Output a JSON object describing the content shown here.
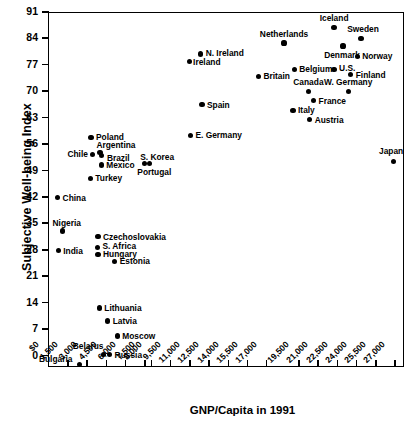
{
  "chart_data": {
    "type": "scatter",
    "title": "",
    "xlabel": "GNP/Capita in 1991",
    "ylabel": "Subjective Well-being Index",
    "xlim": [
      0,
      27750
    ],
    "ylim": [
      -3,
      91
    ],
    "grid": false,
    "legend": "none",
    "yticks": [
      0,
      7,
      14,
      21,
      28,
      35,
      42,
      49,
      56,
      63,
      70,
      77,
      84,
      91
    ],
    "ytick_labels": [
      "0",
      "7",
      "14",
      "21",
      "28",
      "35",
      "42",
      "49",
      "56",
      "63",
      "70",
      "77",
      "84",
      "91"
    ],
    "xticks": [
      0,
      1500,
      3000,
      4500,
      6000,
      7500,
      8000,
      9500,
      11000,
      12500,
      14000,
      15500,
      17000,
      19500,
      21000,
      22500,
      24000,
      25500,
      27000
    ],
    "xtick_labels": [
      "$0",
      "1,500",
      "3,000",
      "4,500",
      "6,000",
      "7,500",
      "8,000",
      "9,500",
      "11,000",
      "12,500",
      "14,000",
      "15,500",
      "17,000",
      "19,500",
      "21,000",
      "22,500",
      "24,000",
      "25,500",
      "27,000"
    ],
    "points": [
      {
        "label": "Iceland",
        "x": 22300,
        "y": 87.0,
        "side": "c",
        "lx": 0,
        "ly": -9
      },
      {
        "label": "Sweden",
        "x": 24400,
        "y": 84.0,
        "side": "c",
        "lx": 2,
        "ly": -9
      },
      {
        "label": "Denmark",
        "x": 23000,
        "y": 82.0,
        "side": "c",
        "lx": -1,
        "ly": 9
      },
      {
        "label": "Netherlands",
        "x": 18400,
        "y": 82.8,
        "side": "c",
        "lx": 0,
        "ly": -9
      },
      {
        "label": "Norway",
        "x": 24100,
        "y": 79.3,
        "side": "r",
        "lx": 5,
        "ly": 0
      },
      {
        "label": "N. Ireland",
        "x": 11900,
        "y": 79.9,
        "side": "r",
        "lx": 5,
        "ly": -1
      },
      {
        "label": "Ireland",
        "x": 11000,
        "y": 78.0,
        "side": "r",
        "lx": 4,
        "ly": 1
      },
      {
        "label": "U.S.",
        "x": 22300,
        "y": 75.8,
        "side": "r",
        "lx": 5,
        "ly": -1
      },
      {
        "label": "Belgium",
        "x": 19200,
        "y": 75.8,
        "side": "r",
        "lx": 5,
        "ly": 0
      },
      {
        "label": "Finland",
        "x": 23600,
        "y": 74.5,
        "side": "r",
        "lx": 5,
        "ly": 1
      },
      {
        "label": "Britain",
        "x": 16400,
        "y": 74.0,
        "side": "r",
        "lx": 5,
        "ly": 0
      },
      {
        "label": "Canada",
        "x": 20300,
        "y": 70.0,
        "side": "c",
        "lx": 0,
        "ly": -9
      },
      {
        "label": "W. Germany",
        "x": 23400,
        "y": 70.0,
        "side": "c",
        "lx": 0,
        "ly": -9
      },
      {
        "label": "France",
        "x": 20700,
        "y": 67.5,
        "side": "r",
        "lx": 5,
        "ly": 0
      },
      {
        "label": "Spain",
        "x": 12000,
        "y": 66.5,
        "side": "r",
        "lx": 5,
        "ly": 0
      },
      {
        "label": "Italy",
        "x": 19100,
        "y": 65.0,
        "side": "r",
        "lx": 5,
        "ly": 0
      },
      {
        "label": "Austria",
        "x": 20400,
        "y": 62.5,
        "side": "r",
        "lx": 5,
        "ly": 0
      },
      {
        "label": "E. Germany",
        "x": 11100,
        "y": 58.3,
        "side": "r",
        "lx": 5,
        "ly": 0
      },
      {
        "label": "Japan",
        "x": 26900,
        "y": 51.5,
        "side": "c",
        "lx": -2,
        "ly": -10
      },
      {
        "label": "Poland",
        "x": 3350,
        "y": 57.8,
        "side": "r",
        "lx": 5,
        "ly": 0
      },
      {
        "label": "Argentina",
        "x": 4050,
        "y": 53.9,
        "side": "c",
        "lx": 16,
        "ly": -7
      },
      {
        "label": "Chile",
        "x": 3500,
        "y": 53.3,
        "side": "l",
        "lx": -5,
        "ly": 0
      },
      {
        "label": "Brazil",
        "x": 4200,
        "y": 53.1,
        "side": "r",
        "lx": 5,
        "ly": 3
      },
      {
        "label": "Mexico",
        "x": 4150,
        "y": 50.5,
        "side": "r",
        "lx": 5,
        "ly": 0
      },
      {
        "label": "S. Korea",
        "x": 7500,
        "y": 50.8,
        "side": "c",
        "lx": 13,
        "ly": -7
      },
      {
        "label": "Portugal",
        "x": 7900,
        "y": 50.8,
        "side": "c",
        "lx": 5,
        "ly": 8
      },
      {
        "label": "Turkey",
        "x": 3300,
        "y": 47.0,
        "side": "r",
        "lx": 5,
        "ly": 0
      },
      {
        "label": "China",
        "x": 750,
        "y": 41.8,
        "side": "r",
        "lx": 5,
        "ly": 0
      },
      {
        "label": "Nigeria",
        "x": 1150,
        "y": 33.0,
        "side": "c",
        "lx": 4,
        "ly": -8
      },
      {
        "label": "Czechoslovakia",
        "x": 3900,
        "y": 31.5,
        "side": "r",
        "lx": 5,
        "ly": 0
      },
      {
        "label": "S. Africa",
        "x": 3850,
        "y": 28.7,
        "side": "r",
        "lx": 5,
        "ly": -1
      },
      {
        "label": "India",
        "x": 800,
        "y": 27.8,
        "side": "r",
        "lx": 5,
        "ly": 0
      },
      {
        "label": "Hungary",
        "x": 3900,
        "y": 26.8,
        "side": "r",
        "lx": 5,
        "ly": 0
      },
      {
        "label": "Estonia",
        "x": 5200,
        "y": 25.0,
        "side": "r",
        "lx": 5,
        "ly": 0
      },
      {
        "label": "Lithuania",
        "x": 4000,
        "y": 12.6,
        "side": "r",
        "lx": 5,
        "ly": 0
      },
      {
        "label": "Latvia",
        "x": 4650,
        "y": 9.2,
        "side": "r",
        "lx": 5,
        "ly": 0
      },
      {
        "label": "Moscow",
        "x": 5400,
        "y": 5.2,
        "side": "r",
        "lx": 5,
        "ly": 0
      },
      {
        "label": "Belarus",
        "x": 4300,
        "y": 0.3,
        "side": "c",
        "lx": -15,
        "ly": -9
      },
      {
        "label": "Russia",
        "x": 4800,
        "y": 0.3,
        "side": "r",
        "lx": 5,
        "ly": 0
      },
      {
        "label": "Bulgaria",
        "x": 2450,
        "y": -2.3,
        "side": "l",
        "lx": -7,
        "ly": -5
      }
    ]
  }
}
